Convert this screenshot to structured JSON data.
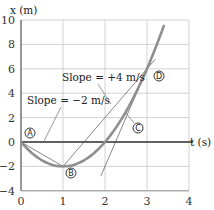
{
  "chart_data": {
    "type": "line",
    "title": "",
    "xlabel": "t (s)",
    "ylabel": "x (m)",
    "xlim": [
      0,
      4
    ],
    "ylim": [
      -4,
      10
    ],
    "grid": true,
    "xticks": [
      "0",
      "1",
      "2",
      "3",
      "4"
    ],
    "yticks": [
      "10",
      "8",
      "6",
      "4",
      "2",
      "0",
      "−2",
      "−4"
    ],
    "series": [
      {
        "name": "x(t) = 2t² − 4t",
        "x": [
          0,
          0.5,
          1,
          1.5,
          2,
          2.5,
          3,
          3.4
        ],
        "y": [
          0,
          -1.5,
          -2,
          -1.5,
          0,
          2.5,
          6,
          9.52
        ]
      }
    ],
    "lines": [
      {
        "name": "chord A-B",
        "from": [
          0,
          0
        ],
        "to": [
          1,
          -2
        ],
        "slope_label": "Slope = −2 m/s"
      },
      {
        "name": "chord B-D",
        "from": [
          1,
          -2
        ],
        "to": [
          3.2,
          6.8
        ],
        "slope_label": "Slope = +4 m/s"
      },
      {
        "name": "tangent at D",
        "from": [
          1.9,
          -2.8
        ],
        "to": [
          3.15,
          7.2
        ]
      }
    ],
    "points": [
      {
        "label": "A",
        "t": 0,
        "x": 0
      },
      {
        "label": "B",
        "t": 1,
        "x": -2
      },
      {
        "label": "C",
        "t": 2.5,
        "x": 2.5
      },
      {
        "label": "D",
        "t": 3,
        "x": 6
      }
    ],
    "annotations": [
      "Slope = +4 m/s",
      "Slope = −2 m/s"
    ]
  },
  "labels": {
    "y_axis": "x (m)",
    "x_axis": "t (s)",
    "slope_pos": "Slope = +4 m/s",
    "slope_neg": "Slope = −2 m/s",
    "A": "A",
    "B": "B",
    "C": "C",
    "D": "D"
  }
}
